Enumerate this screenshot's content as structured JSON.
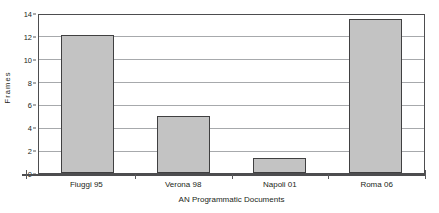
{
  "chart_data": {
    "type": "bar",
    "title": "",
    "xlabel": "AN Programmatic Documents",
    "ylabel": "Frames",
    "categories": [
      "Fiuggi 95",
      "Verona 98",
      "Napoli 01",
      "Roma 06"
    ],
    "values": [
      12.1,
      5.0,
      1.3,
      13.5
    ],
    "ylim": [
      0,
      14
    ],
    "ytick_step": 2,
    "yticks": [
      "0",
      "2",
      "4",
      "6",
      "8",
      "10",
      "12",
      "14"
    ],
    "grid": true,
    "legend": "none",
    "series": [
      {
        "name": "Frames",
        "values": [
          12.1,
          5.0,
          1.3,
          13.5
        ]
      }
    ],
    "colors": {
      "bar_fill": "#c3c3c3",
      "bar_border": "#404041",
      "gridline": "#a7a9ac",
      "axis": "#4d4d4f",
      "text": "#231f20",
      "background": "#ffffff"
    }
  }
}
